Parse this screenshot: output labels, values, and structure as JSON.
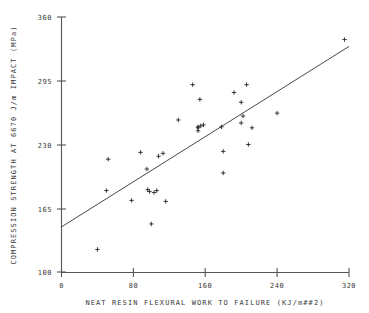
{
  "chart_data": {
    "type": "scatter",
    "title": "",
    "xlabel": "NEAT RESIN FLEXURAL WORK TO FAILURE (KJ/m##2)",
    "ylabel": "COMPRESSION STRENGTH AT 6670 J/m IMPACT (MPa)",
    "xlim": [
      0,
      320
    ],
    "ylim": [
      100,
      360
    ],
    "xticks": [
      0,
      80,
      160,
      240,
      320
    ],
    "yticks": [
      100,
      165,
      230,
      295,
      360
    ],
    "xtick_labels": [
      "0",
      "80",
      "160",
      "240",
      "320"
    ],
    "ytick_labels": [
      "100",
      "165",
      "230",
      "295",
      "360"
    ],
    "grid": false,
    "legend": "none",
    "marker": "plus",
    "marker_color": "#1a1a1a",
    "line_color": "#333333",
    "axis_color": "#555555",
    "background": "#ffffff",
    "series": [
      {
        "name": "specimens",
        "points": [
          [
            40,
            123
          ],
          [
            52,
            215
          ],
          [
            50,
            183
          ],
          [
            78,
            173
          ],
          [
            88,
            222
          ],
          [
            96,
            184
          ],
          [
            98,
            182
          ],
          [
            95,
            205
          ],
          [
            100,
            149
          ],
          [
            103,
            181
          ],
          [
            106,
            183
          ],
          [
            108,
            218
          ],
          [
            113,
            221
          ],
          [
            116,
            172
          ],
          [
            130,
            255
          ],
          [
            146,
            291
          ],
          [
            152,
            244
          ],
          [
            152,
            248
          ],
          [
            154,
            276
          ],
          [
            155,
            249
          ],
          [
            158,
            250
          ],
          [
            152,
            247
          ],
          [
            178,
            248
          ],
          [
            180,
            223
          ],
          [
            180,
            201
          ],
          [
            192,
            283
          ],
          [
            200,
            252
          ],
          [
            200,
            273
          ],
          [
            202,
            259
          ],
          [
            206,
            291
          ],
          [
            208,
            230
          ],
          [
            212,
            247
          ],
          [
            240,
            262
          ],
          [
            315,
            337
          ]
        ]
      }
    ],
    "fit_line": {
      "name": "least-squares fit",
      "x_start": 0,
      "y_start": 146,
      "x_end": 320,
      "y_end": 330
    }
  }
}
